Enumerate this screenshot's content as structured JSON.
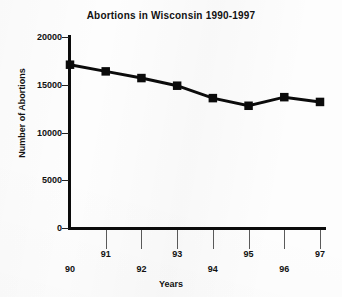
{
  "chart_data": {
    "type": "line",
    "title": "Abortions in Wisconsin 1990-1997",
    "xlabel": "Years",
    "ylabel": "Number of Abortions",
    "categories": [
      "90",
      "91",
      "92",
      "93",
      "94",
      "95",
      "96",
      "97"
    ],
    "values": [
      17100,
      16400,
      15700,
      14900,
      13600,
      12800,
      13700,
      13200
    ],
    "series": [
      {
        "name": "Abortions",
        "values": [
          17100,
          16400,
          15700,
          14900,
          13600,
          12800,
          13700,
          13200
        ]
      }
    ],
    "x_tick_labels": [
      "90",
      "91",
      "92",
      "93",
      "94",
      "95",
      "96",
      "97"
    ],
    "y_tick_labels": [
      "0",
      "5000",
      "10000",
      "15000",
      "20000"
    ],
    "y_tick_values": [
      0,
      5000,
      10000,
      15000,
      20000
    ],
    "ylim": [
      0,
      20000
    ],
    "xlim": [
      "90",
      "97"
    ],
    "grid": false,
    "legend": "none",
    "marker": "square",
    "line_color": "#0b0b0b",
    "marker_color": "#0b0b0b",
    "background_color": "#fdfdfd",
    "text_color": "#111111"
  }
}
